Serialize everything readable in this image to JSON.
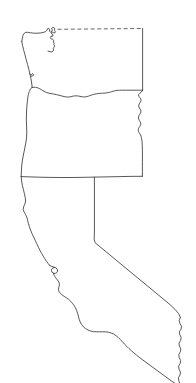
{
  "map": {
    "title": "West Coast States Outline",
    "type": "outline-map",
    "projection": "plate-carree",
    "background_color": "#ffffff",
    "line_color": "#3a3a3a",
    "line_width_px": 0.85,
    "canvas": {
      "width": 196,
      "height": 383
    },
    "regions": [
      {
        "id": "washington",
        "name": "Washington",
        "label_visible": false,
        "fill_color": "#ffffff",
        "stroke_color": "#3a3a3a",
        "bbox": [
          21,
          27,
          143,
          97
        ]
      },
      {
        "id": "oregon",
        "name": "Oregon",
        "label_visible": false,
        "fill_color": "#ffffff",
        "stroke_color": "#3a3a3a",
        "bbox": [
          17,
          88,
          143,
          178
        ]
      },
      {
        "id": "california",
        "name": "California",
        "label_visible": false,
        "fill_color": "#ffffff",
        "stroke_color": "#3a3a3a",
        "bbox": [
          17,
          176,
          192,
          383
        ]
      }
    ],
    "borders": [
      {
        "id": "canada-usa-border",
        "name": "Canada - United States border (49th parallel)",
        "style": "dashed",
        "stroke_color": "#4a4a4a",
        "dash_pattern": "4 2.6"
      },
      {
        "id": "washington-oregon-border",
        "name": "Washington - Oregon border (Columbia River)",
        "style": "solid",
        "stroke_color": "#3a3a3a"
      },
      {
        "id": "oregon-idaho-border",
        "name": "Oregon - Idaho border (Snake River)",
        "style": "solid",
        "stroke_color": "#3a3a3a"
      },
      {
        "id": "oregon-california-border",
        "name": "Oregon - California border (42nd parallel)",
        "style": "solid",
        "stroke_color": "#3a3a3a"
      },
      {
        "id": "california-nevada-border",
        "name": "California - Nevada border",
        "style": "solid",
        "stroke_color": "#3a3a3a"
      },
      {
        "id": "california-arizona-border",
        "name": "California - Arizona border (Colorado River)",
        "style": "solid",
        "stroke_color": "#3a3a3a"
      },
      {
        "id": "pacific-coastline",
        "name": "Pacific Ocean coastline",
        "style": "solid",
        "stroke_color": "#3a3a3a"
      }
    ],
    "legend": {
      "visible": false,
      "entries": []
    },
    "labels": [],
    "graticule": {
      "visible": false
    }
  }
}
